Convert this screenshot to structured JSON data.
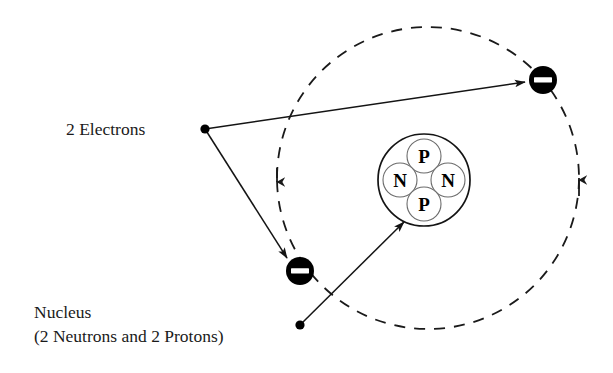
{
  "diagram": {
    "background_color": "#ffffff",
    "stroke_color": "#141414",
    "labels": {
      "electrons": "2 Electrons",
      "nucleus_line1": "Nucleus",
      "nucleus_line2": "(2 Neutrons and 2 Protons)"
    },
    "nucleus": {
      "center_x": 424,
      "center_y": 180,
      "radius": 46,
      "particles": [
        {
          "symbol": "P",
          "name": "proton",
          "cx": 424,
          "cy": 156,
          "r": 17
        },
        {
          "symbol": "N",
          "name": "neutron",
          "cx": 400,
          "cy": 180,
          "r": 17
        },
        {
          "symbol": "N",
          "name": "neutron",
          "cx": 448,
          "cy": 180,
          "r": 17
        },
        {
          "symbol": "P",
          "name": "proton",
          "cx": 424,
          "cy": 204,
          "r": 17
        }
      ]
    },
    "orbit": {
      "center_x": 428,
      "center_y": 178,
      "radius": 151,
      "style": "dashed",
      "direction_markers": [
        {
          "name": "orbit-arrow-left",
          "x": 277,
          "y": 178,
          "points": "down"
        },
        {
          "name": "orbit-arrow-right",
          "x": 579,
          "y": 182,
          "points": "up"
        }
      ]
    },
    "electrons": [
      {
        "name": "electron-upper-right",
        "cx": 543,
        "cy": 80,
        "r": 14,
        "charge": "-"
      },
      {
        "name": "electron-lower-left",
        "cx": 300,
        "cy": 271,
        "r": 14,
        "charge": "-"
      }
    ],
    "pointers": [
      {
        "name": "electrons-pointer-dot",
        "origin_x": 205,
        "origin_y": 129,
        "targets": [
          {
            "x": 525,
            "y": 82
          },
          {
            "x": 287,
            "y": 258
          }
        ]
      },
      {
        "name": "nucleus-pointer-dot",
        "origin_x": 300,
        "origin_y": 325,
        "targets": [
          {
            "x": 404,
            "y": 222
          }
        ]
      }
    ]
  }
}
